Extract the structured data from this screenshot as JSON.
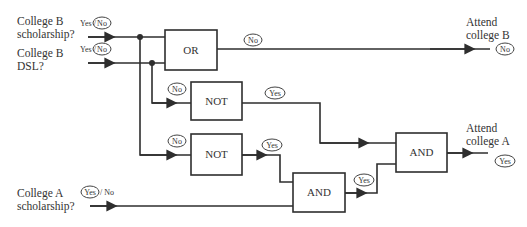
{
  "inputs": [
    {
      "id": "b_scholarship",
      "label_line1": "College B",
      "label_line2": "scholarship?",
      "options_yes": "Yes",
      "options_sep": "/",
      "options_no": "No",
      "selected": "No"
    },
    {
      "id": "b_dsl",
      "label_line1": "College B",
      "label_line2": "DSL?",
      "options_yes": "Yes",
      "options_sep": "/",
      "options_no": "No",
      "selected": "No"
    },
    {
      "id": "a_scholarship",
      "label_line1": "College A",
      "label_line2": "scholarship?",
      "options_yes": "Yes",
      "options_sep": "/",
      "options_no": "No",
      "selected": "Yes"
    }
  ],
  "gates": [
    {
      "id": "or",
      "label": "OR"
    },
    {
      "id": "not1",
      "label": "NOT"
    },
    {
      "id": "not2",
      "label": "NOT"
    },
    {
      "id": "and1",
      "label": "AND"
    },
    {
      "id": "and2",
      "label": "AND"
    }
  ],
  "signals": {
    "or_out": "No",
    "not1_in": "No",
    "not1_out": "Yes",
    "not2_in": "No",
    "not2_out": "Yes",
    "and1_out": "Yes",
    "attend_b": "No",
    "attend_a": "Yes"
  },
  "outputs": [
    {
      "id": "attend_b",
      "label_line1": "Attend",
      "label_line2": "college B",
      "value": "No"
    },
    {
      "id": "attend_a",
      "label_line1": "Attend",
      "label_line2": "college A",
      "value": "Yes"
    }
  ],
  "colors": {
    "line": "#2e2e2e",
    "text": "#333333"
  }
}
